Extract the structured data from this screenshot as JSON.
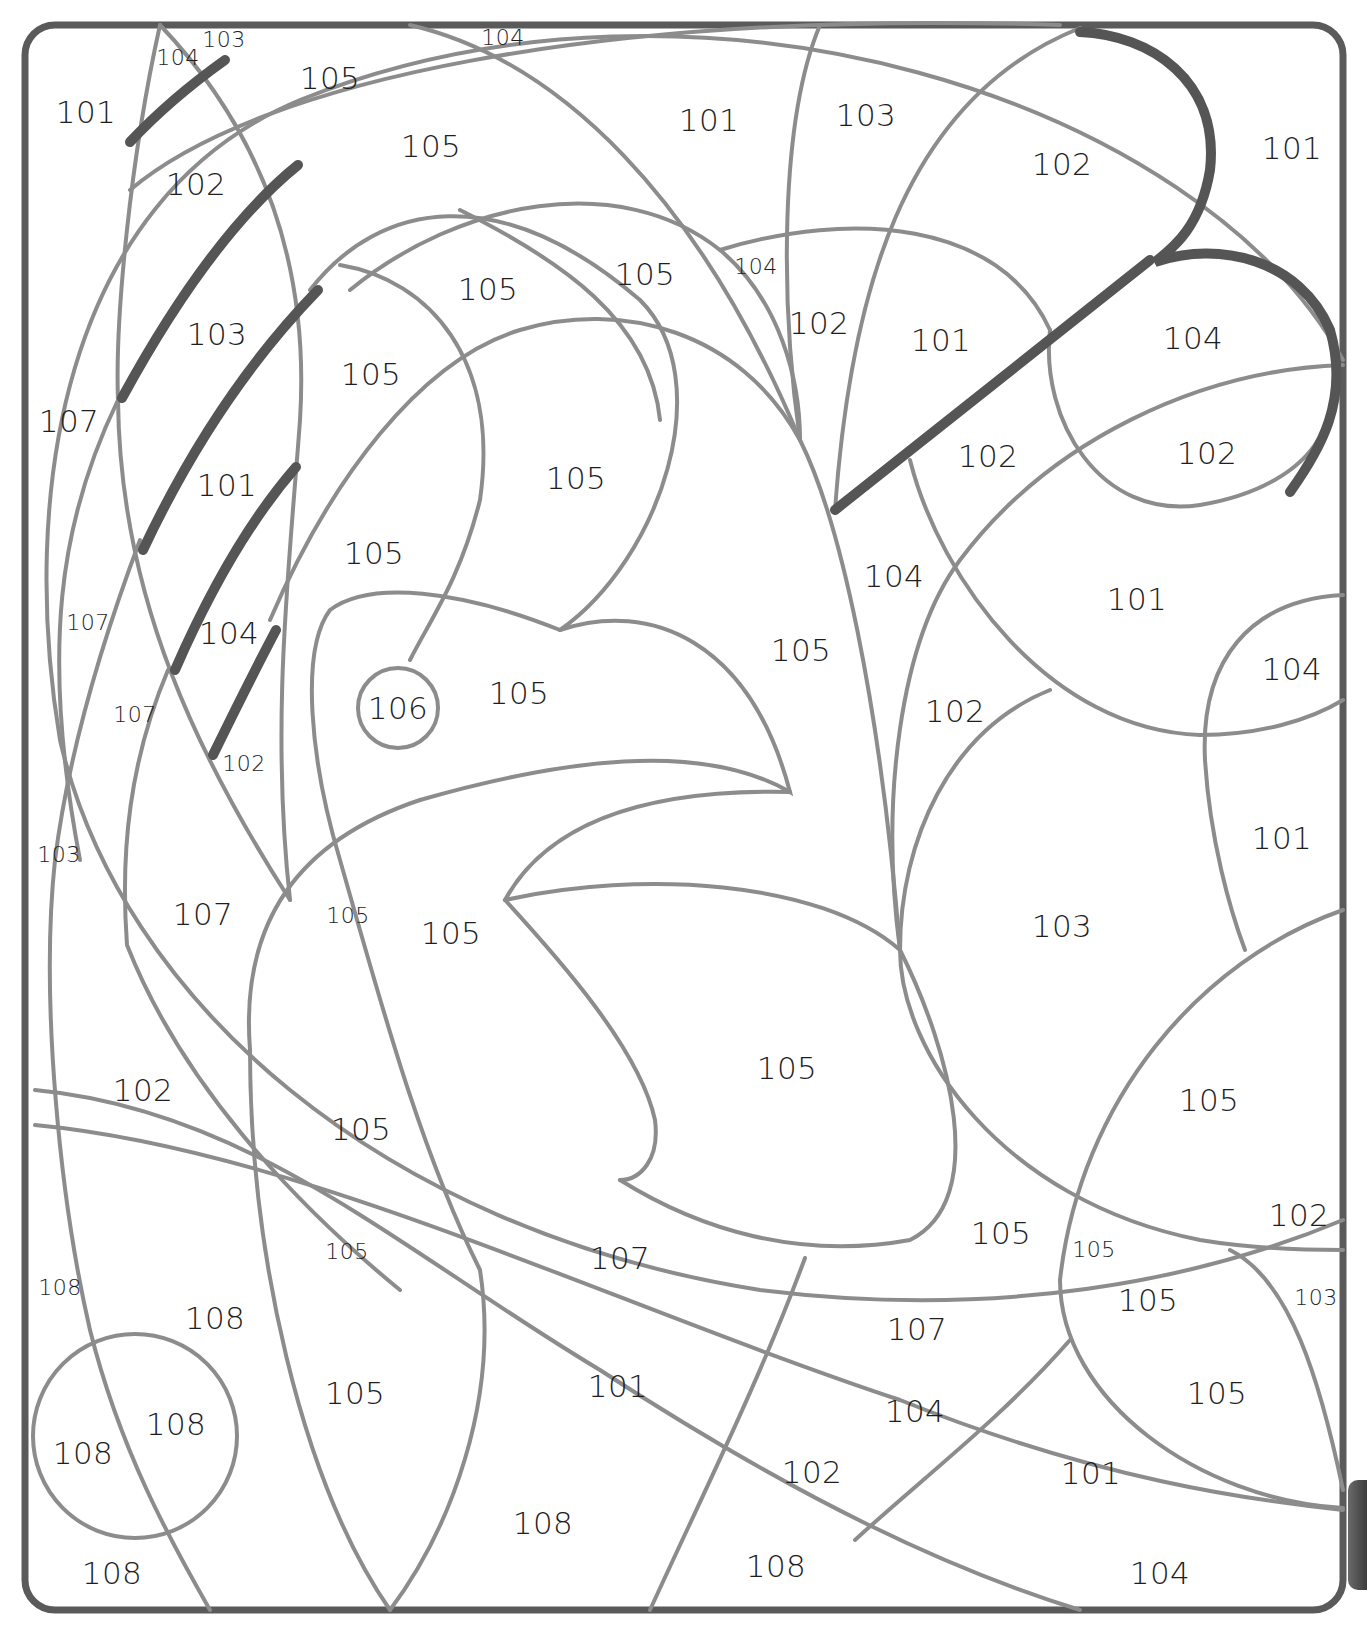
{
  "page": {
    "type": "color-by-number",
    "colors": {
      "frame": "#5a5a5a",
      "outline": "#8c8c8c",
      "bold_stroke": "#555555",
      "text": "#1e1e1e",
      "background": "#ffffff"
    }
  },
  "regions": [
    {
      "label": "101",
      "x": 86,
      "y": 112,
      "size": "big"
    },
    {
      "label": "104",
      "x": 178,
      "y": 58,
      "size": "small"
    },
    {
      "label": "103",
      "x": 224,
      "y": 40,
      "size": "small"
    },
    {
      "label": "105",
      "x": 330,
      "y": 78,
      "size": "big"
    },
    {
      "label": "104",
      "x": 503,
      "y": 38,
      "size": "small"
    },
    {
      "label": "102",
      "x": 196,
      "y": 184,
      "size": "big"
    },
    {
      "label": "105",
      "x": 431,
      "y": 146,
      "size": "big"
    },
    {
      "label": "101",
      "x": 709,
      "y": 120,
      "size": "big"
    },
    {
      "label": "103",
      "x": 866,
      "y": 115,
      "size": "big"
    },
    {
      "label": "102",
      "x": 1062,
      "y": 164,
      "size": "big"
    },
    {
      "label": "101",
      "x": 1292,
      "y": 148,
      "size": "big"
    },
    {
      "label": "105",
      "x": 488,
      "y": 289,
      "size": "big"
    },
    {
      "label": "105",
      "x": 645,
      "y": 274,
      "size": "big"
    },
    {
      "label": "104",
      "x": 756,
      "y": 267,
      "size": "small"
    },
    {
      "label": "102",
      "x": 819,
      "y": 323,
      "size": "big"
    },
    {
      "label": "101",
      "x": 941,
      "y": 340,
      "size": "big"
    },
    {
      "label": "104",
      "x": 1193,
      "y": 338,
      "size": "big"
    },
    {
      "label": "103",
      "x": 217,
      "y": 334,
      "size": "big"
    },
    {
      "label": "105",
      "x": 371,
      "y": 374,
      "size": "big"
    },
    {
      "label": "107",
      "x": 69,
      "y": 421,
      "size": "big"
    },
    {
      "label": "102",
      "x": 988,
      "y": 456,
      "size": "big"
    },
    {
      "label": "102",
      "x": 1207,
      "y": 453,
      "size": "big"
    },
    {
      "label": "101",
      "x": 227,
      "y": 485,
      "size": "big"
    },
    {
      "label": "105",
      "x": 576,
      "y": 478,
      "size": "big"
    },
    {
      "label": "105",
      "x": 374,
      "y": 553,
      "size": "big"
    },
    {
      "label": "104",
      "x": 894,
      "y": 576,
      "size": "big"
    },
    {
      "label": "101",
      "x": 1137,
      "y": 599,
      "size": "big"
    },
    {
      "label": "107",
      "x": 88,
      "y": 623,
      "size": "small"
    },
    {
      "label": "104",
      "x": 229,
      "y": 633,
      "size": "big"
    },
    {
      "label": "105",
      "x": 801,
      "y": 650,
      "size": "big"
    },
    {
      "label": "104",
      "x": 1292,
      "y": 669,
      "size": "big"
    },
    {
      "label": "106",
      "x": 398,
      "y": 708,
      "size": "big"
    },
    {
      "label": "105",
      "x": 519,
      "y": 693,
      "size": "big"
    },
    {
      "label": "107",
      "x": 135,
      "y": 715,
      "size": "small"
    },
    {
      "label": "102",
      "x": 955,
      "y": 711,
      "size": "big"
    },
    {
      "label": "102",
      "x": 244,
      "y": 764,
      "size": "small"
    },
    {
      "label": "101",
      "x": 1282,
      "y": 838,
      "size": "big"
    },
    {
      "label": "103",
      "x": 59,
      "y": 855,
      "size": "small"
    },
    {
      "label": "107",
      "x": 203,
      "y": 914,
      "size": "big"
    },
    {
      "label": "105",
      "x": 348,
      "y": 916,
      "size": "small"
    },
    {
      "label": "105",
      "x": 451,
      "y": 933,
      "size": "big"
    },
    {
      "label": "103",
      "x": 1062,
      "y": 926,
      "size": "big"
    },
    {
      "label": "105",
      "x": 787,
      "y": 1068,
      "size": "big"
    },
    {
      "label": "102",
      "x": 143,
      "y": 1090,
      "size": "big"
    },
    {
      "label": "105",
      "x": 1209,
      "y": 1100,
      "size": "big"
    },
    {
      "label": "105",
      "x": 361,
      "y": 1129,
      "size": "big"
    },
    {
      "label": "105",
      "x": 1001,
      "y": 1233,
      "size": "big"
    },
    {
      "label": "102",
      "x": 1299,
      "y": 1215,
      "size": "big"
    },
    {
      "label": "105",
      "x": 347,
      "y": 1252,
      "size": "small"
    },
    {
      "label": "105",
      "x": 1094,
      "y": 1250,
      "size": "small"
    },
    {
      "label": "107",
      "x": 620,
      "y": 1258,
      "size": "big"
    },
    {
      "label": "105",
      "x": 1148,
      "y": 1300,
      "size": "big"
    },
    {
      "label": "103",
      "x": 1316,
      "y": 1298,
      "size": "small"
    },
    {
      "label": "108",
      "x": 60,
      "y": 1288,
      "size": "small"
    },
    {
      "label": "108",
      "x": 215,
      "y": 1318,
      "size": "big"
    },
    {
      "label": "107",
      "x": 917,
      "y": 1329,
      "size": "big"
    },
    {
      "label": "101",
      "x": 618,
      "y": 1386,
      "size": "big"
    },
    {
      "label": "105",
      "x": 355,
      "y": 1393,
      "size": "big"
    },
    {
      "label": "105",
      "x": 1217,
      "y": 1393,
      "size": "big"
    },
    {
      "label": "108",
      "x": 176,
      "y": 1424,
      "size": "big"
    },
    {
      "label": "104",
      "x": 915,
      "y": 1411,
      "size": "big"
    },
    {
      "label": "108",
      "x": 83,
      "y": 1453,
      "size": "big"
    },
    {
      "label": "102",
      "x": 812,
      "y": 1472,
      "size": "big"
    },
    {
      "label": "101",
      "x": 1091,
      "y": 1473,
      "size": "big"
    },
    {
      "label": "108",
      "x": 543,
      "y": 1523,
      "size": "big"
    },
    {
      "label": "108",
      "x": 112,
      "y": 1573,
      "size": "big"
    },
    {
      "label": "108",
      "x": 776,
      "y": 1566,
      "size": "big"
    },
    {
      "label": "104",
      "x": 1160,
      "y": 1573,
      "size": "big"
    }
  ]
}
